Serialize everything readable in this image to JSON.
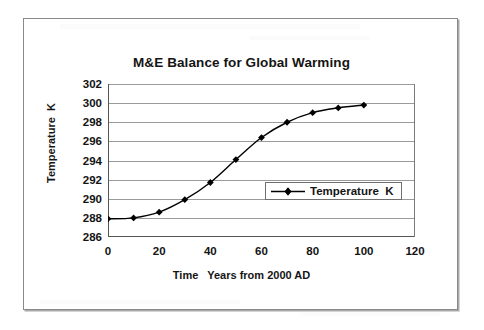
{
  "chart_data": {
    "type": "line",
    "title": "M&E Balance for Global Warming",
    "xlabel": "Time   Years from 2000 AD",
    "ylabel": "Temperature  K",
    "xlim": [
      0,
      120
    ],
    "ylim": [
      286,
      302
    ],
    "xticks": [
      0,
      20,
      40,
      60,
      80,
      100,
      120
    ],
    "yticks": [
      286,
      288,
      290,
      292,
      294,
      296,
      298,
      300,
      302
    ],
    "grid": "horizontal",
    "legend": {
      "position": "inside-center-right",
      "entries": [
        "Temperature  K"
      ]
    },
    "series": [
      {
        "name": "Temperature  K",
        "marker": "diamond",
        "color": "#000000",
        "x": [
          0,
          10,
          20,
          30,
          40,
          50,
          60,
          70,
          80,
          90,
          100
        ],
        "values": [
          287.9,
          288.0,
          288.6,
          289.9,
          291.7,
          294.1,
          296.4,
          298.0,
          299.0,
          299.5,
          299.8
        ]
      }
    ]
  },
  "labels": {
    "y_ticks": [
      "302",
      "300",
      "298",
      "296",
      "294",
      "292",
      "290",
      "288",
      "286"
    ],
    "x_ticks": [
      "0",
      "20",
      "40",
      "60",
      "80",
      "100",
      "120"
    ]
  },
  "colors": {
    "line": "#000000",
    "grid": "#9a9a9a",
    "axis": "#555555",
    "frame": "#8a8a8a",
    "text": "#141414",
    "background": "#ffffff"
  }
}
